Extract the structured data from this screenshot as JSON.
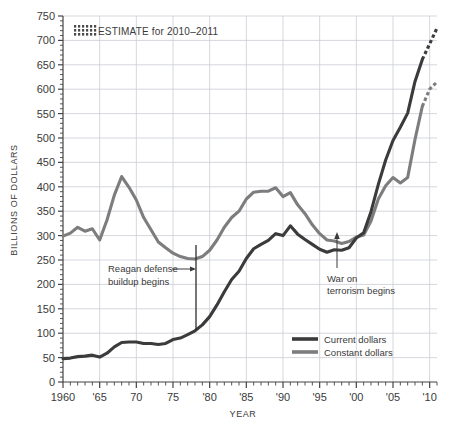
{
  "chart_data": {
    "type": "line",
    "title": "",
    "xlabel": "YEAR",
    "ylabel": "BILLIONS OF DOLLARS",
    "xlim": [
      1960,
      2011
    ],
    "ylim": [
      0,
      750
    ],
    "grid": true,
    "y_ticks": [
      0,
      50,
      100,
      150,
      200,
      250,
      300,
      350,
      400,
      450,
      500,
      550,
      600,
      650,
      700,
      750
    ],
    "y_tick_labels": [
      "0",
      "50",
      "100",
      "150",
      "200",
      "250",
      "300",
      "350",
      "400",
      "450",
      "500",
      "550",
      "600",
      "650",
      "700",
      "750"
    ],
    "x_ticks": [
      1960,
      1965,
      1970,
      1975,
      1980,
      1985,
      1990,
      1995,
      2000,
      2005,
      2010
    ],
    "x_tick_labels": [
      "1960",
      "'65",
      "70",
      "75",
      "'80",
      "'85",
      "'90",
      "'95",
      "'00",
      "'05",
      "'10"
    ],
    "minor_tick_step": 1,
    "legend_position": "inside-lower-right",
    "series": [
      {
        "name": "Current dollars",
        "color": "#3b3b3b",
        "x": [
          1960,
          1961,
          1962,
          1963,
          1964,
          1965,
          1966,
          1967,
          1968,
          1969,
          1970,
          1971,
          1972,
          1973,
          1974,
          1975,
          1976,
          1977,
          1978,
          1979,
          1980,
          1981,
          1982,
          1983,
          1984,
          1985,
          1986,
          1987,
          1988,
          1989,
          1990,
          1991,
          1992,
          1993,
          1994,
          1995,
          1996,
          1997,
          1998,
          1999,
          2000,
          2001,
          2002,
          2003,
          2004,
          2005,
          2006,
          2007,
          2008,
          2009,
          2010,
          2011
        ],
        "values": [
          48,
          49,
          52,
          53,
          55,
          51,
          59,
          72,
          81,
          82,
          82,
          79,
          79,
          77,
          79,
          87,
          90,
          97,
          105,
          117,
          134,
          158,
          185,
          210,
          227,
          253,
          273,
          282,
          290,
          304,
          300,
          320,
          303,
          292,
          282,
          272,
          266,
          271,
          270,
          275,
          295,
          306,
          349,
          405,
          455,
          495,
          522,
          551,
          616,
          661,
          693,
          725
        ]
      },
      {
        "name": "Constant dollars",
        "color": "#7d7d7d",
        "x": [
          1960,
          1961,
          1962,
          1963,
          1964,
          1965,
          1966,
          1967,
          1968,
          1969,
          1970,
          1971,
          1972,
          1973,
          1974,
          1975,
          1976,
          1977,
          1978,
          1979,
          1980,
          1981,
          1982,
          1983,
          1984,
          1985,
          1986,
          1987,
          1988,
          1989,
          1990,
          1991,
          1992,
          1993,
          1994,
          1995,
          1996,
          1997,
          1998,
          1999,
          2000,
          2001,
          2002,
          2003,
          2004,
          2005,
          2006,
          2007,
          2008,
          2009,
          2010,
          2011
        ],
        "values": [
          299,
          305,
          317,
          309,
          314,
          291,
          332,
          383,
          421,
          399,
          373,
          337,
          312,
          287,
          275,
          264,
          257,
          253,
          252,
          257,
          270,
          291,
          317,
          337,
          350,
          375,
          389,
          391,
          391,
          398,
          380,
          388,
          363,
          345,
          322,
          304,
          291,
          289,
          284,
          288,
          297,
          301,
          330,
          375,
          402,
          419,
          408,
          419,
          497,
          565,
          600,
          615
        ]
      }
    ],
    "annotations": [
      {
        "id": "reagan",
        "text_lines": [
          "Reagan defense",
          "buildup begins"
        ],
        "pointer_year": 1981,
        "marker_type": "vertical-bar"
      },
      {
        "id": "war-on-terror",
        "text_lines": [
          "War on",
          "terrorism begins"
        ],
        "pointer_year": 2001,
        "marker_type": "up-arrow"
      }
    ],
    "estimate": {
      "label": "ESTIMATE for 2010–2011",
      "swatch": "hatched-dots",
      "start_year": 2010,
      "end_year": 2011
    }
  },
  "legend": {
    "items": [
      {
        "label": "Current dollars",
        "color": "#3b3b3b"
      },
      {
        "label": "Constant dollars",
        "color": "#7d7d7d"
      }
    ]
  },
  "axis": {
    "y_title": "BILLIONS OF DOLLARS",
    "x_title": "YEAR"
  },
  "colors": {
    "current_dollars": "#3b3b3b",
    "constant_dollars": "#7d7d7d",
    "grid": "#c9cdd4",
    "axis": "#444444",
    "text": "#3a3a3a",
    "background": "#ffffff"
  }
}
